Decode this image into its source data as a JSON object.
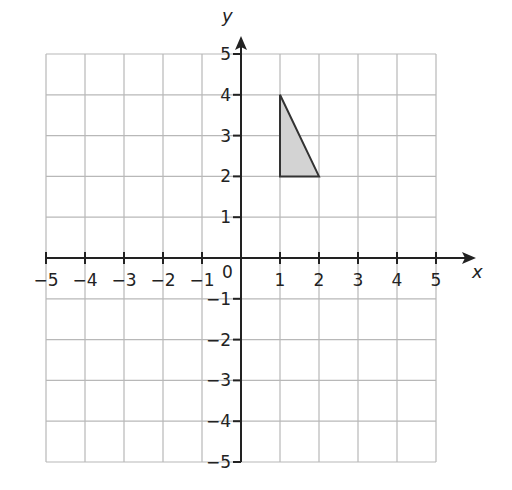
{
  "chart_data": {
    "type": "scatter",
    "title": "",
    "xlabel": "x",
    "ylabel": "y",
    "xlim": [
      -5,
      5
    ],
    "ylim": [
      -5,
      5
    ],
    "grid": true,
    "x_ticks": [
      -5,
      -4,
      -3,
      -2,
      -1,
      1,
      2,
      3,
      4,
      5
    ],
    "y_ticks": [
      -5,
      -4,
      -3,
      -2,
      -1,
      1,
      2,
      3,
      4,
      5
    ],
    "origin_label": "0",
    "shapes": [
      {
        "type": "polygon",
        "name": "triangle",
        "vertices": [
          [
            1,
            4
          ],
          [
            1,
            2
          ],
          [
            2,
            2
          ]
        ],
        "fill": "#d3d3d3",
        "stroke": "#333333"
      }
    ]
  },
  "colors": {
    "grid": "#b8b8b8",
    "axis": "#222222",
    "shape_fill": "#d3d3d3",
    "shape_stroke": "#333333"
  }
}
